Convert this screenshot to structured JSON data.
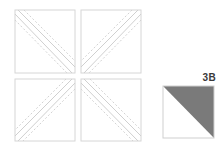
{
  "diagram": {
    "type": "quilt half-square triangle assembly",
    "units": [
      {
        "position": "top-left",
        "diagonal": "tl-br"
      },
      {
        "position": "top-right",
        "diagonal": "tr-bl"
      },
      {
        "position": "bottom-left",
        "diagonal": "tr-bl"
      },
      {
        "position": "bottom-right",
        "diagonal": "tl-br"
      }
    ],
    "result": {
      "label": "3B",
      "shaded_half": "upper-right",
      "shade_color": "#7a7a7a"
    },
    "colors": {
      "outline": "#d6d6d6",
      "seam": "#d0d0d0",
      "dashed": "#cfcfcf"
    }
  }
}
